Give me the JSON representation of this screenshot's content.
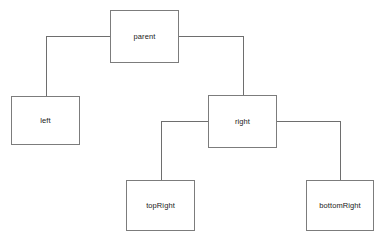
{
  "diagram": {
    "type": "tree",
    "background_color": "#ffffff",
    "node_border_color": "#7c7c7c",
    "node_fill_color": "#ffffff",
    "edge_color": "#6e6e6e",
    "label_color": "#1a1a1a",
    "nodes": [
      {
        "id": "parent",
        "label": "parent",
        "x": 110,
        "y": 10,
        "width": 69,
        "height": 53
      },
      {
        "id": "left",
        "label": "left",
        "x": 11,
        "y": 96,
        "width": 69,
        "height": 49
      },
      {
        "id": "right",
        "label": "right",
        "x": 208,
        "y": 95,
        "width": 69,
        "height": 53
      },
      {
        "id": "topRight",
        "label": "topRight",
        "x": 126,
        "y": 180,
        "width": 69,
        "height": 51
      },
      {
        "id": "bottomRight",
        "label": "bottomRight",
        "x": 306,
        "y": 180,
        "width": 68,
        "height": 51
      }
    ],
    "edges": [
      {
        "id": "parent-left",
        "from": "parent",
        "to": "left",
        "from_side": "left",
        "to_side": "top",
        "points": "110,36 46,36 46,96"
      },
      {
        "id": "parent-right",
        "from": "parent",
        "to": "right",
        "from_side": "right",
        "to_side": "top",
        "points": "179,36 243,36 243,95"
      },
      {
        "id": "right-topRight",
        "from": "right",
        "to": "topRight",
        "from_side": "left",
        "to_side": "top",
        "points": "208,121 161,121 161,180"
      },
      {
        "id": "right-bottomRight",
        "from": "right",
        "to": "bottomRight",
        "from_side": "right",
        "to_side": "top",
        "points": "277,121 340,121 340,180"
      }
    ]
  }
}
